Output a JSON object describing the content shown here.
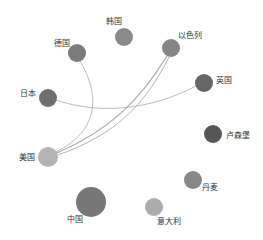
{
  "chart_data": {
    "type": "network-graph",
    "title": "",
    "layout": "circular",
    "nodes": [
      {
        "id": "korea",
        "label": "韩国",
        "x": 124,
        "y": 37,
        "r": 9,
        "color": "#8a8a8a",
        "label_x": 106,
        "label_y": 24,
        "label_anchor": "start"
      },
      {
        "id": "israel",
        "label": "以色列",
        "x": 171,
        "y": 48,
        "r": 9,
        "color": "#858585",
        "label_x": 178,
        "label_y": 38,
        "label_anchor": "start"
      },
      {
        "id": "germany",
        "label": "德国",
        "x": 77,
        "y": 53,
        "r": 9,
        "color": "#7b7b7b",
        "label_x": 54,
        "label_y": 46,
        "label_anchor": "start"
      },
      {
        "id": "uk",
        "label": "英国",
        "x": 204,
        "y": 83,
        "r": 9,
        "color": "#666666",
        "label_x": 216,
        "label_y": 83,
        "label_anchor": "start"
      },
      {
        "id": "japan",
        "label": "日本",
        "x": 48,
        "y": 98,
        "r": 9,
        "color": "#6f6f6f",
        "label_x": 20,
        "label_y": 96,
        "label_anchor": "start"
      },
      {
        "id": "luxembourg",
        "label": "卢森堡",
        "x": 213,
        "y": 134,
        "r": 9,
        "color": "#565656",
        "label_x": 226,
        "label_y": 138,
        "label_anchor": "start"
      },
      {
        "id": "usa",
        "label": "美国",
        "x": 48,
        "y": 157,
        "r": 10,
        "color": "#b4b4b4",
        "label_x": 19,
        "label_y": 160,
        "label_anchor": "start"
      },
      {
        "id": "denmark",
        "label": "丹麦",
        "x": 193,
        "y": 180,
        "r": 9,
        "color": "#888888",
        "label_x": 202,
        "label_y": 190,
        "label_anchor": "start"
      },
      {
        "id": "china",
        "label": "中国",
        "x": 91,
        "y": 202,
        "r": 15,
        "color": "#777777",
        "label_x": 67,
        "label_y": 222,
        "label_anchor": "start"
      },
      {
        "id": "italy",
        "label": "意大利",
        "x": 154,
        "y": 207,
        "r": 9,
        "color": "#acacac",
        "label_x": 157,
        "label_y": 224,
        "label_anchor": "start"
      }
    ],
    "edges": [
      {
        "source": "germany",
        "target": "usa",
        "path": "M80,61 C100,95 100,130 56,152",
        "color": "#bbbbbb",
        "width": 1
      },
      {
        "source": "japan",
        "target": "uk",
        "path": "M56,100 C100,115 150,110 196,86",
        "color": "#bdbdbd",
        "width": 1
      },
      {
        "source": "israel",
        "target": "usa",
        "path": "M167,56 C140,100 110,130 57,153",
        "color": "#a8a8a8",
        "width": 1.2
      },
      {
        "source": "israel",
        "target": "usa",
        "path": "M169,57 C145,105 115,135 58,155",
        "color": "#b5b5b5",
        "width": 1
      }
    ],
    "legend": "none",
    "grid": false
  }
}
